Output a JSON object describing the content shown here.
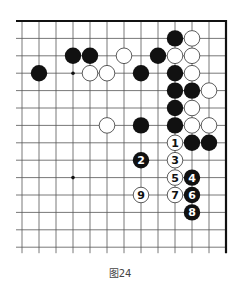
{
  "caption": "图24",
  "board": {
    "columns": 13,
    "rows": 14,
    "origin_x": 22,
    "origin_y": 21,
    "spacing_x": 17,
    "spacing_y": 17.4,
    "edges": {
      "top": true,
      "right": true,
      "left": false,
      "bottom": false
    },
    "star_points": [
      [
        3,
        3
      ],
      [
        3,
        9
      ]
    ],
    "colors": {
      "line": "#555555",
      "edge": "#111111",
      "black": "#111111",
      "white": "#ffffff",
      "white_stroke": "#333333"
    }
  },
  "stones": {
    "black": [
      [
        3,
        2
      ],
      [
        4,
        2
      ],
      [
        1,
        3
      ],
      [
        9,
        1
      ],
      [
        8,
        2
      ],
      [
        7,
        3
      ],
      [
        9,
        3
      ],
      [
        9,
        4
      ],
      [
        10,
        4
      ],
      [
        9,
        5
      ],
      [
        9,
        6
      ],
      [
        7,
        6
      ],
      [
        10,
        7
      ],
      [
        11,
        7
      ]
    ],
    "white": [
      [
        10,
        1
      ],
      [
        6,
        2
      ],
      [
        9,
        2
      ],
      [
        10,
        2
      ],
      [
        4,
        3
      ],
      [
        5,
        3
      ],
      [
        10,
        3
      ],
      [
        11,
        4
      ],
      [
        10,
        5
      ],
      [
        10,
        6
      ],
      [
        11,
        6
      ],
      [
        5,
        6
      ]
    ]
  },
  "moves": [
    {
      "n": "1",
      "color": "white",
      "col": 9,
      "row": 7
    },
    {
      "n": "2",
      "color": "black",
      "col": 7,
      "row": 8
    },
    {
      "n": "3",
      "color": "white",
      "col": 9,
      "row": 8
    },
    {
      "n": "4",
      "color": "black",
      "col": 10,
      "row": 9
    },
    {
      "n": "5",
      "color": "white",
      "col": 9,
      "row": 9
    },
    {
      "n": "6",
      "color": "black",
      "col": 10,
      "row": 10
    },
    {
      "n": "7",
      "color": "white",
      "col": 9,
      "row": 10
    },
    {
      "n": "8",
      "color": "black",
      "col": 10,
      "row": 11
    },
    {
      "n": "9",
      "color": "white",
      "col": 7,
      "row": 10
    }
  ]
}
